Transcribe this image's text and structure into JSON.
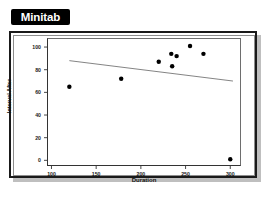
{
  "badge": {
    "label": "Minitab",
    "background": "#000000",
    "text_color": "#ffffff"
  },
  "figure": {
    "frame_color": "#1a1a1a",
    "shadow_color": "#bfbfbf",
    "background": "#ffffff"
  },
  "chart_data": {
    "type": "scatter",
    "title": "",
    "xlabel": "Duration",
    "ylabel": "Interval After",
    "xlim": [
      95,
      312
    ],
    "ylim": [
      -5,
      108
    ],
    "xticks": [
      100,
      150,
      200,
      250,
      300
    ],
    "xtick_labels": [
      "100",
      "150",
      "200",
      "250",
      "300"
    ],
    "yticks": [
      0,
      20,
      40,
      60,
      80,
      100
    ],
    "ytick_labels": [
      "0",
      "20",
      "40",
      "60",
      "80",
      "100"
    ],
    "grid": false,
    "legend": null,
    "marker": {
      "shape": "circle",
      "color": "#000000",
      "size": 3
    },
    "points": [
      {
        "x": 120,
        "y": 65
      },
      {
        "x": 178,
        "y": 72
      },
      {
        "x": 220,
        "y": 87
      },
      {
        "x": 234,
        "y": 94
      },
      {
        "x": 235,
        "y": 83
      },
      {
        "x": 240,
        "y": 92
      },
      {
        "x": 255,
        "y": 101
      },
      {
        "x": 270,
        "y": 94
      },
      {
        "x": 300,
        "y": 1
      }
    ],
    "fit_line": {
      "name": "regression-line",
      "color": "#767676",
      "x_start": 120,
      "y_start": 88,
      "x_end": 303,
      "y_end": 70
    }
  }
}
